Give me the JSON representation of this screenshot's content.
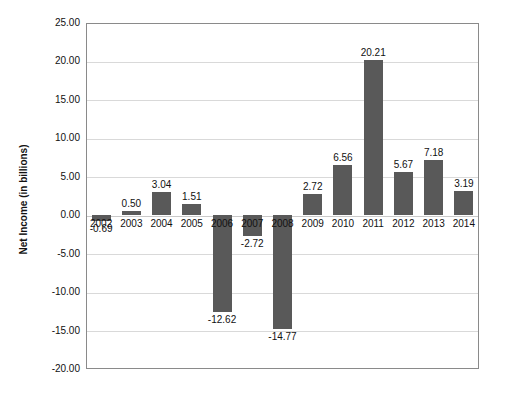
{
  "chart_data": {
    "type": "bar",
    "title": "",
    "subtitle": "",
    "xlabel": "",
    "ylabel": "Net Income (in billions)",
    "categories": [
      "2002",
      "2003",
      "2004",
      "2005",
      "2006",
      "2007",
      "2008",
      "2009",
      "2010",
      "2011",
      "2012",
      "2013",
      "2014"
    ],
    "values": [
      -0.69,
      0.5,
      3.04,
      1.51,
      -12.62,
      -2.72,
      -14.77,
      2.72,
      6.56,
      20.21,
      5.67,
      7.18,
      3.19
    ],
    "data_labels": [
      "-0.69",
      "0.50",
      "3.04",
      "1.51",
      "-12.62",
      "-2.72",
      "-14.77",
      "2.72",
      "6.56",
      "20.21",
      "5.67",
      "7.18",
      "3.19"
    ],
    "ylim": [
      -20.0,
      25.0
    ],
    "ytick_values": [
      25.0,
      20.0,
      15.0,
      10.0,
      5.0,
      0.0,
      -5.0,
      -10.0,
      -15.0,
      -20.0
    ],
    "ytick_labels": [
      "25.00",
      "20.00",
      "15.00",
      "10.00",
      "5.00",
      "0.00",
      "-5.00",
      "-10.00",
      "-15.00",
      "-20.00"
    ],
    "grid": true,
    "legend": false,
    "legend_position": "none",
    "series": [
      {
        "name": "Net Income",
        "color": "#595959",
        "values": [
          -0.69,
          0.5,
          3.04,
          1.51,
          -12.62,
          -2.72,
          -14.77,
          2.72,
          6.56,
          20.21,
          5.67,
          7.18,
          3.19
        ]
      }
    ],
    "colors": {
      "bar": "#595959",
      "grid": "#d9d9d9",
      "frame": "#8a8a8a",
      "text": "#111111",
      "background": "#ffffff"
    }
  }
}
